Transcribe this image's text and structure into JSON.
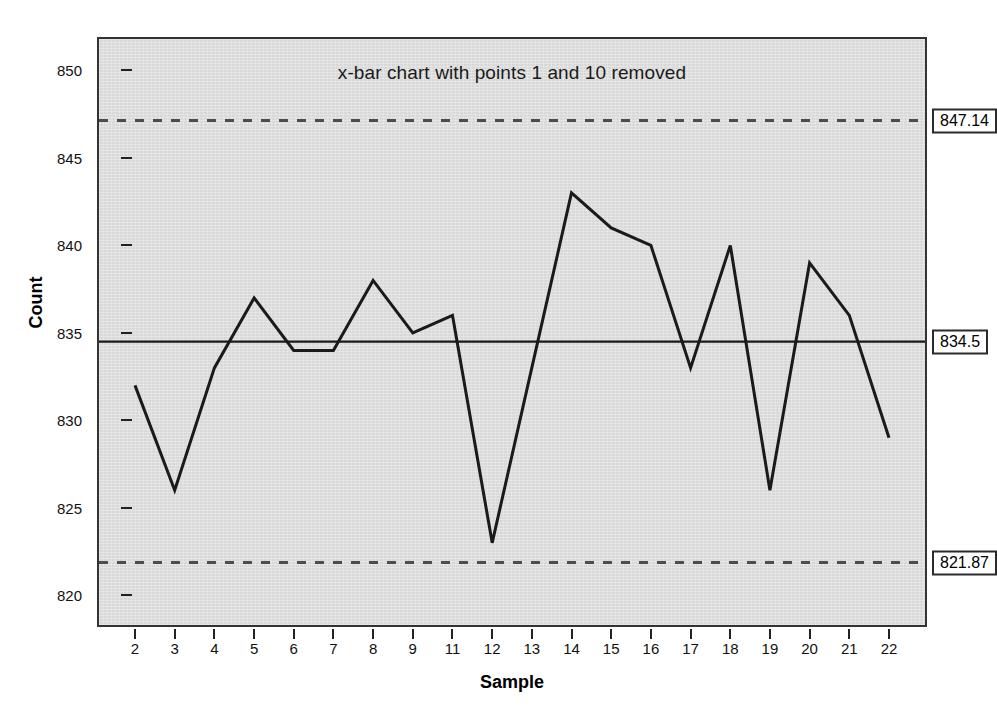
{
  "chart_data": {
    "type": "line",
    "title": "x-bar chart with points 1 and 10 removed",
    "xlabel": "Sample",
    "ylabel": "Count",
    "categories": [
      "2",
      "3",
      "4",
      "5",
      "6",
      "7",
      "8",
      "9",
      "11",
      "12",
      "13",
      "14",
      "15",
      "16",
      "17",
      "18",
      "19",
      "20",
      "21",
      "22"
    ],
    "values": [
      832,
      826,
      833,
      837,
      834,
      834,
      838,
      835,
      836,
      823,
      833,
      843,
      841,
      840,
      833,
      840,
      826,
      839,
      836,
      829
    ],
    "series": [
      {
        "name": "Count",
        "values": [
          832,
          826,
          833,
          837,
          834,
          834,
          838,
          835,
          836,
          823,
          833,
          843,
          841,
          840,
          833,
          840,
          826,
          839,
          836,
          829
        ]
      }
    ],
    "ylim": [
      818.3,
      851.8
    ],
    "yticks": [
      820,
      825,
      830,
      835,
      840,
      845,
      850
    ],
    "ytick_labels": [
      "820",
      "825",
      "830",
      "835",
      "840",
      "845",
      "850"
    ],
    "grid": false,
    "legend": "none",
    "control_limits": {
      "ucl": 847.14,
      "ucl_label": "847.14",
      "center": 834.5,
      "center_label": "834.5",
      "lcl": 821.87,
      "lcl_label": "821.87"
    },
    "colors": {
      "plot_background": "#d9d9d9",
      "series_line": "#1a1a1a",
      "center_line": "#1a1a1a",
      "limit_line": "#4d4d4d",
      "frame": "#333333",
      "page_background": "#ffffff"
    }
  }
}
